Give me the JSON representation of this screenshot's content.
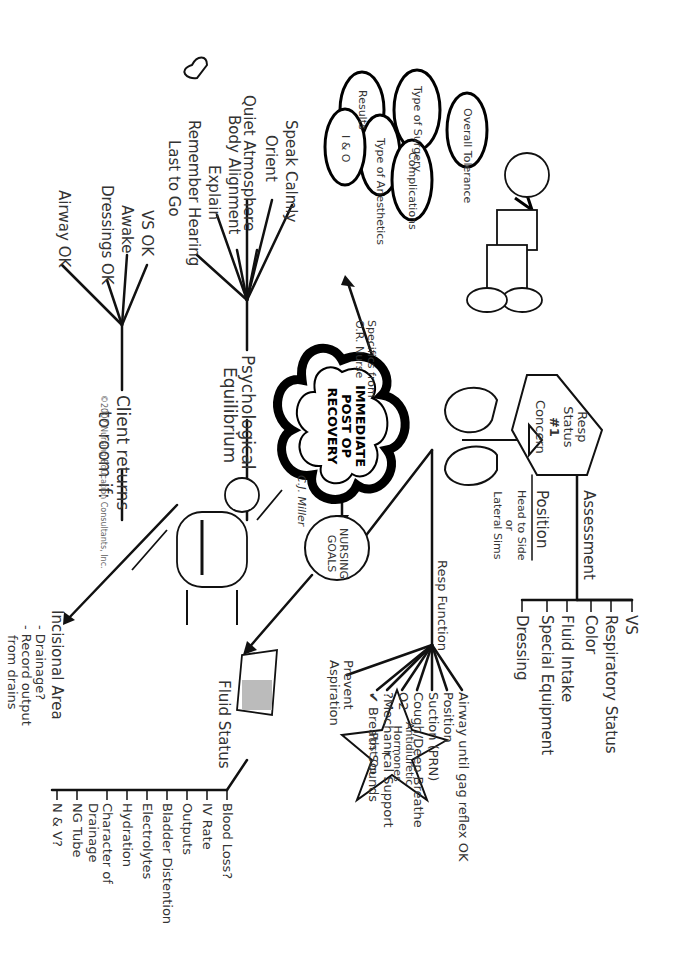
{
  "center": {
    "title_lines": [
      "IMMEDIATE",
      "POST OP",
      "RECOVERY"
    ],
    "signature": "C.J. Miller"
  },
  "or_nurse": {
    "label_lines": [
      "Specifics from",
      "O.R. Nurse"
    ],
    "bubbles": [
      "Overall Tolerance",
      "Type of Surgery",
      "Type of Anesthetics",
      "Results",
      "Complications",
      "I & O"
    ]
  },
  "resp_status": {
    "hexagon_lines": [
      "Resp",
      "Status",
      "#1",
      "Concern"
    ],
    "assessment_label": "Assessment",
    "assessment_items": [
      "VS",
      "Respiratory Status",
      "Color",
      "Fluid Intake",
      "Special Equipment",
      "Dressing"
    ],
    "position_label": "Position",
    "position_lines": [
      "Head to Side",
      "or",
      "Lateral Sims"
    ]
  },
  "nursing_goals": {
    "label_lines": [
      "NURSING",
      "GOALS"
    ],
    "resp_function": {
      "label": "Resp Function",
      "items": [
        "Airway until gag reflex OK",
        "Position",
        "Suction (PRN)",
        "Cough/Deep Breathe",
        "O2",
        "?Mechanical Support",
        "✔ Breath Sounds",
        "Prevent Aspiration"
      ]
    },
    "fluid_status": {
      "label": "Fluid Status",
      "items": [
        "Blood Loss?",
        "IV Rate",
        "Outputs",
        "Bladder Distention",
        "Electrolytes",
        "Hydration",
        "Character of Drainage",
        "NG Tube",
        "N & V?"
      ]
    },
    "star_lines": [
      "Antidiuretic",
      "Hormones",
      "↑",
      "Post Op"
    ],
    "incisional_area": {
      "label": "Incisional Area",
      "items": [
        "- Drainage?",
        "- Record output",
        "from drains"
      ]
    }
  },
  "psychological": {
    "label_lines": [
      "Psychological",
      "Equilibrium"
    ],
    "items": [
      "Speak Calmly",
      "Orient",
      "Quiet Atmosphere",
      "Body Alignment",
      "Explain",
      "Remember Hearing",
      "Last to Go"
    ]
  },
  "client_returns": {
    "label_lines": [
      "Client returns",
      "to room if:"
    ],
    "items": [
      "VS OK",
      "Awake",
      "Dressings OK",
      "Airway OK"
    ]
  },
  "copyright": "©2007 Nursing Education Consultants, Inc."
}
